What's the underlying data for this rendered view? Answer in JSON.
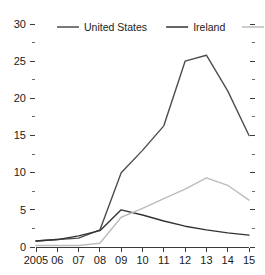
{
  "chart_data": {
    "type": "line",
    "title": "",
    "xlabel": "",
    "ylabel": "",
    "x": [
      2005,
      2006,
      2007,
      2008,
      2009,
      2010,
      2011,
      2012,
      2013,
      2014,
      2015
    ],
    "x_tick_labels": [
      "2005",
      "06",
      "07",
      "08",
      "09",
      "10",
      "11",
      "12",
      "13",
      "14",
      "15"
    ],
    "y_tick_labels": [
      "0",
      "5",
      "10",
      "15",
      "20",
      "25",
      "30"
    ],
    "y_ticks": [
      0,
      5,
      10,
      15,
      20,
      25,
      30
    ],
    "y_minor_ticks": [
      2.5,
      7.5,
      12.5,
      17.5,
      22.5,
      27.5
    ],
    "xlim": [
      2005,
      2015
    ],
    "ylim": [
      0,
      30
    ],
    "grid": false,
    "legend_position": "top",
    "series": [
      {
        "name": "United States",
        "color": "#4d4d4d",
        "values": [
          0.8,
          1.0,
          1.2,
          2.3,
          10.0,
          13.0,
          16.3,
          25.0,
          25.8,
          21.0,
          15.0
        ]
      },
      {
        "name": "Ireland",
        "color": "#333333",
        "values": [
          0.8,
          1.0,
          1.5,
          2.2,
          5.0,
          4.3,
          3.5,
          2.8,
          2.3,
          1.9,
          1.6
        ]
      },
      {
        "name": "Spain",
        "color": "#bcbcbc",
        "values": [
          0.2,
          0.2,
          0.2,
          0.5,
          4.0,
          5.2,
          6.5,
          7.8,
          9.3,
          8.3,
          6.3
        ]
      }
    ]
  },
  "legend": {
    "items": [
      {
        "label": "United States",
        "color": "#4d4d4d"
      },
      {
        "label": "Ireland",
        "color": "#333333"
      },
      {
        "label": "Spain",
        "color": "#bcbcbc"
      }
    ]
  },
  "axes": {
    "y_labels": [
      "30",
      "25",
      "20",
      "15",
      "10",
      "5",
      "0"
    ],
    "x_labels": [
      "2005",
      "06",
      "07",
      "08",
      "09",
      "10",
      "11",
      "12",
      "13",
      "14",
      "15"
    ]
  }
}
